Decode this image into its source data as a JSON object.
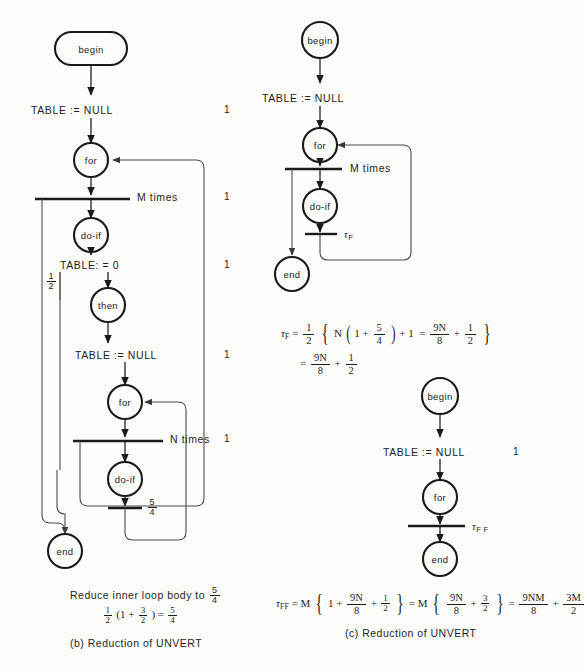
{
  "figure": {
    "panels": [
      {
        "id": "b",
        "caption": "(b)   Reduction of UNVERT",
        "nodes": [
          {
            "name": "begin",
            "shape": "stadium"
          },
          {
            "name": "for",
            "shape": "circle"
          },
          {
            "name": "do-if",
            "shape": "circle"
          },
          {
            "name": "then",
            "shape": "circle"
          },
          {
            "name": "for",
            "shape": "circle"
          },
          {
            "name": "do-if",
            "shape": "circle"
          },
          {
            "name": "end",
            "shape": "circle"
          }
        ],
        "statements": [
          {
            "text": "TABLE := NULL",
            "count": "1"
          },
          {
            "text": "M times",
            "count": "1"
          },
          {
            "text": "TABLE: = 0",
            "count": "1"
          },
          {
            "text": "TABLE := NULL",
            "count": "1"
          },
          {
            "text": "N times",
            "count": "1"
          }
        ],
        "weights": [
          {
            "num": "1",
            "den": "2"
          },
          {
            "num": "5",
            "den": "4"
          }
        ],
        "note_text": "Reduce inner loop body to",
        "note_frac": {
          "num": "5",
          "den": "4"
        },
        "note_equation": {
          "lhs_frac": {
            "num": "1",
            "den": "2"
          },
          "open": "(1 +",
          "inner_frac": {
            "num": "3",
            "den": "2"
          },
          "close": ") =",
          "result_frac": {
            "num": "5",
            "den": "4"
          }
        }
      },
      {
        "id": "c-top",
        "nodes": [
          {
            "name": "begin",
            "shape": "circle"
          },
          {
            "name": "for",
            "shape": "circle"
          },
          {
            "name": "do-if",
            "shape": "circle"
          },
          {
            "name": "end",
            "shape": "circle"
          }
        ],
        "statements": [
          {
            "text": "TABLE := NULL",
            "count": ""
          },
          {
            "text": "M times",
            "count": ""
          }
        ],
        "tau_label": "τ",
        "tau_sub": "F"
      },
      {
        "id": "c-bottom",
        "caption": "(c)   Reduction of UNVERT",
        "nodes": [
          {
            "name": "begin",
            "shape": "circle"
          },
          {
            "name": "for",
            "shape": "circle"
          },
          {
            "name": "end",
            "shape": "circle"
          }
        ],
        "statements": [
          {
            "text": "TABLE := NULL",
            "count": "1"
          }
        ],
        "tau_label": "τ",
        "tau_sub": "F F"
      }
    ],
    "equations": {
      "tau_f": {
        "symbol": "τ",
        "sub": "F",
        "eq1": "=",
        "half": {
          "num": "1",
          "den": "2"
        },
        "brace_open": "{",
        "term_n": "N",
        "paren_open": "(",
        "one_plus": "1 +",
        "five_fourths": {
          "num": "5",
          "den": "4"
        },
        "paren_close": ")",
        "plus_one": "+ 1",
        "eq2": "=",
        "nine_n_eighths": {
          "num": "9N",
          "den": "8"
        },
        "plus": "+",
        "half2": {
          "num": "1",
          "den": "2"
        },
        "brace_close": "}",
        "line2_eq": "=",
        "line2_a": {
          "num": "9N",
          "den": "8"
        },
        "line2_plus": "+",
        "line2_b": {
          "num": "1",
          "den": "2"
        }
      },
      "tau_ff": {
        "symbol": "τ",
        "sub": "FF",
        "eq1": "=",
        "m1": "M",
        "brace1_open": "{",
        "one_plus": "1 +",
        "f1": {
          "num": "9N",
          "den": "8"
        },
        "plus1": "+",
        "f2": {
          "num": "1",
          "den": "2"
        },
        "brace1_close": "}",
        "eq2": "=",
        "m2": "M",
        "brace2_open": "{",
        "f3": {
          "num": "9N",
          "den": "8"
        },
        "plus2": "+",
        "f4": {
          "num": "3",
          "den": "2"
        },
        "brace2_close": "}",
        "eq3": "=",
        "f5": {
          "num": "9NM",
          "den": "8"
        },
        "plus3": "+",
        "f6": {
          "num": "3M",
          "den": "2"
        }
      }
    },
    "colors": {
      "ink": "#1a1a1a",
      "paper": "#fdfdfb",
      "thin": "#5a5a5a"
    }
  }
}
